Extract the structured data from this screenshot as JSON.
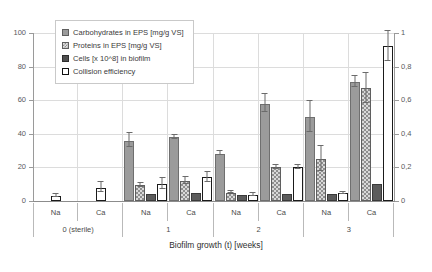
{
  "chart_data": {
    "type": "bar",
    "title": "",
    "xlabel": "Biofilm growth (t) [weeks]",
    "ylabel": "",
    "ylim": [
      0,
      100
    ],
    "y2lim": [
      0,
      1
    ],
    "grid": true,
    "legend_position": "top-left",
    "yticks": [
      "0",
      "20",
      "40",
      "60",
      "80",
      "100"
    ],
    "ytick_values": [
      0,
      20,
      40,
      60,
      80,
      100
    ],
    "y2ticks": [
      "0",
      "0,2",
      "0,4",
      "0,6",
      "0,8",
      "1"
    ],
    "y2tick_values": [
      0,
      0.2,
      0.4,
      0.6,
      0.8,
      1
    ],
    "categories": [
      "Na",
      "Ca",
      "Na",
      "Ca",
      "Na",
      "Ca",
      "Na",
      "Ca"
    ],
    "group_labels": [
      "0  (sterile)",
      "1",
      "2",
      "3"
    ],
    "series": [
      {
        "name": "Carbohydrates in EPS [mg/g VS]",
        "axis": "left",
        "values": [
          0,
          0,
          36,
          38,
          28,
          58,
          50,
          71
        ],
        "errors": [
          0,
          0,
          4.5,
          1.5,
          1.5,
          5.5,
          9.5,
          3.5
        ]
      },
      {
        "name": "Proteins in EPS [mg/g VS]",
        "axis": "left",
        "values": [
          0,
          0,
          9.5,
          12,
          5,
          20,
          25,
          67
        ],
        "errors": [
          0,
          0,
          1.5,
          2.5,
          1,
          1.5,
          8,
          9
        ]
      },
      {
        "name": "Cells [x 10^8] in biofilm",
        "axis": "left",
        "values": [
          0,
          0,
          4,
          5,
          3.5,
          4,
          4,
          10
        ],
        "errors": [
          0,
          0,
          0,
          0,
          0,
          0,
          0,
          0
        ]
      },
      {
        "name": "Collision efficiency",
        "axis": "right",
        "values": [
          0.03,
          0.08,
          0.1,
          0.14,
          0.035,
          0.2,
          0.045,
          0.92
        ],
        "errors": [
          0.012,
          0.035,
          0.035,
          0.03,
          0.01,
          0.015,
          0.01,
          0.09
        ]
      }
    ]
  },
  "legend": {
    "items": [
      {
        "label": "Carbohydrates in EPS [mg/g VS]",
        "swatch": "carb"
      },
      {
        "label": "Proteins in EPS [mg/g VS]",
        "swatch": "prot"
      },
      {
        "label": "Cells [x 10^8] in biofilm",
        "swatch": "cells"
      },
      {
        "label": "Collision efficiency",
        "swatch": "coll"
      }
    ]
  }
}
